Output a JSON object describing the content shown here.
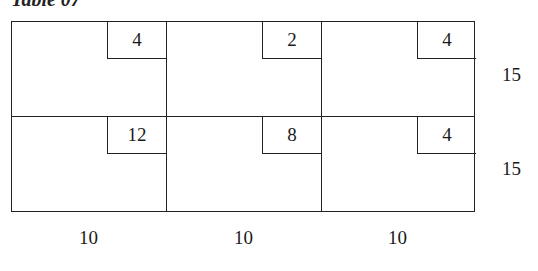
{
  "title": "Table 07",
  "table": {
    "rows": [
      {
        "costs": [
          "4",
          "2",
          "4"
        ],
        "supply": "15"
      },
      {
        "costs": [
          "12",
          "8",
          "4"
        ],
        "supply": "15"
      }
    ],
    "demand": [
      "10",
      "10",
      "10"
    ]
  }
}
